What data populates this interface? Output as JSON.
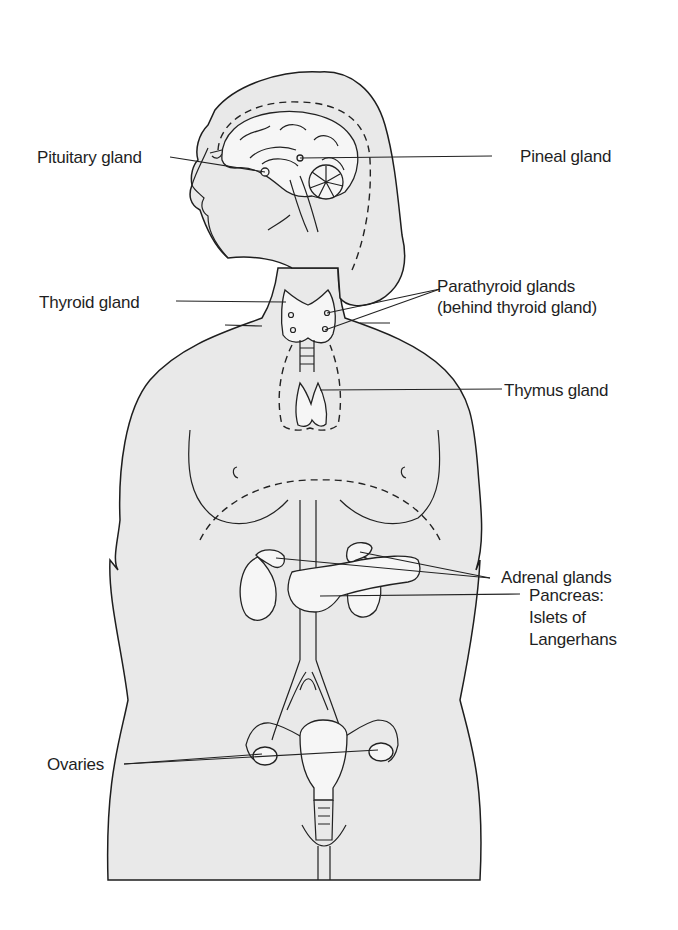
{
  "figure": {
    "colors": {
      "body_fill": "#e9e9e9",
      "outline": "#1e1e1e",
      "organ_fill": "#f6f6f6",
      "background": "#ffffff"
    }
  },
  "labels": {
    "pituitary": "Pituitary gland",
    "pineal": "Pineal gland",
    "thyroid": "Thyroid gland",
    "parathyroid_line1": "Parathyroid glands",
    "parathyroid_line2": "(behind thyroid gland)",
    "thymus": "Thymus gland",
    "adrenal": "Adrenal glands",
    "pancreas_line1": "Pancreas:",
    "pancreas_line2": "Islets of",
    "pancreas_line3": "Langerhans",
    "ovaries": "Ovaries"
  }
}
